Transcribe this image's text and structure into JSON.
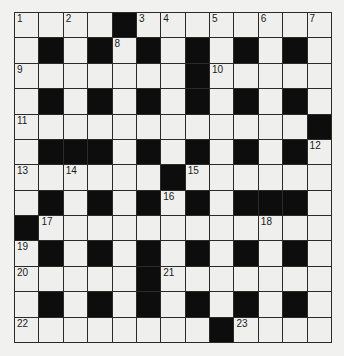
{
  "puzzle": {
    "type": "crossword",
    "rows": 13,
    "cols": 13,
    "colors": {
      "background": "#f1f1ef",
      "white_cell": "#efefed",
      "black_cell": "#0d0d0d",
      "grid_line": "#2a2a2a"
    },
    "layout": [
      "....#........",
      ".#.#.#.#.#.#.",
      ".......#.....",
      ".#.#.#.#.#.#.",
      "............#",
      ".###.#.#.#.#.",
      "......#......",
      ".#.#.#.#.###.",
      "#............",
      ".#.#.#.#.#.#.",
      ".....#.......",
      ".#.#.#.#.#.#.",
      "........#...."
    ],
    "numbers": [
      {
        "row": 0,
        "col": 0,
        "n": "1"
      },
      {
        "row": 0,
        "col": 2,
        "n": "2"
      },
      {
        "row": 0,
        "col": 5,
        "n": "3"
      },
      {
        "row": 0,
        "col": 6,
        "n": "4"
      },
      {
        "row": 0,
        "col": 8,
        "n": "5"
      },
      {
        "row": 0,
        "col": 10,
        "n": "6"
      },
      {
        "row": 0,
        "col": 12,
        "n": "7"
      },
      {
        "row": 1,
        "col": 4,
        "n": "8"
      },
      {
        "row": 2,
        "col": 0,
        "n": "9"
      },
      {
        "row": 2,
        "col": 8,
        "n": "10"
      },
      {
        "row": 4,
        "col": 0,
        "n": "11"
      },
      {
        "row": 5,
        "col": 12,
        "n": "12"
      },
      {
        "row": 6,
        "col": 0,
        "n": "13"
      },
      {
        "row": 6,
        "col": 2,
        "n": "14"
      },
      {
        "row": 6,
        "col": 7,
        "n": "15"
      },
      {
        "row": 7,
        "col": 6,
        "n": "16"
      },
      {
        "row": 8,
        "col": 1,
        "n": "17"
      },
      {
        "row": 8,
        "col": 10,
        "n": "18"
      },
      {
        "row": 9,
        "col": 0,
        "n": "19"
      },
      {
        "row": 10,
        "col": 0,
        "n": "20"
      },
      {
        "row": 10,
        "col": 6,
        "n": "21"
      },
      {
        "row": 12,
        "col": 0,
        "n": "22"
      },
      {
        "row": 12,
        "col": 9,
        "n": "23"
      }
    ]
  }
}
